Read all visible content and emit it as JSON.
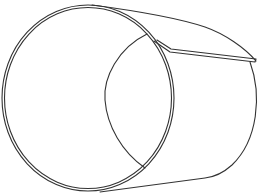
{
  "figure": {
    "subject": "Line drawing of a rolled metal sheet forming an open cylinder with an overlapping seam flap",
    "stroke_color": "#333333",
    "background_color": "#ffffff"
  }
}
